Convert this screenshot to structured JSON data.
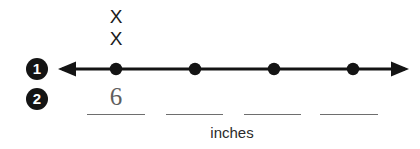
{
  "worksheet": {
    "width": 420,
    "height": 149,
    "background": "#ffffff",
    "ink_color": "#141414",
    "pencil_color": "#5e5e5e",
    "rule_color": "#6e6e6e"
  },
  "steps": [
    {
      "number": "1",
      "name": "plot-on-number-line"
    },
    {
      "number": "2",
      "name": "write-measurements"
    }
  ],
  "plot": {
    "marks": [
      "X",
      "X"
    ],
    "mark_symbol": "X",
    "mark_count": 2,
    "marks_over_point_index": 0
  },
  "number_line": {
    "left_arrow": "left-arrow",
    "right_arrow": "right-arrow",
    "line_start_x": 60,
    "line_end_x": 407,
    "line_y": 14,
    "point_count": 4,
    "points": [
      {
        "x": 116,
        "label": ""
      },
      {
        "x": 195,
        "label": ""
      },
      {
        "x": 274,
        "label": ""
      },
      {
        "x": 353,
        "label": ""
      }
    ]
  },
  "answers": {
    "blanks": [
      {
        "value": "6"
      },
      {
        "value": ""
      },
      {
        "value": ""
      },
      {
        "value": ""
      }
    ]
  },
  "unit": {
    "label": "inches"
  }
}
